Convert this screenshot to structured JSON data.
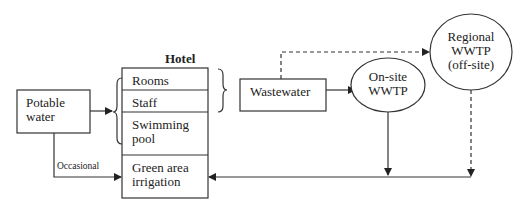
{
  "diagram": {
    "hotel": {
      "title": "Hotel",
      "sections": [
        "Rooms",
        "Staff",
        "Swimming",
        "pool",
        "Green area",
        "irrigation"
      ]
    },
    "potable_water": {
      "line1": "Potable",
      "line2": "water"
    },
    "occasional_label": "Occasional",
    "wastewater": "Wastewater",
    "onsite_wwtp": {
      "line1": "On-site",
      "line2": "WWTP"
    },
    "regional_wwtp": {
      "line1": "Regional",
      "line2": "WWTP",
      "line3": "(off-site)"
    }
  }
}
